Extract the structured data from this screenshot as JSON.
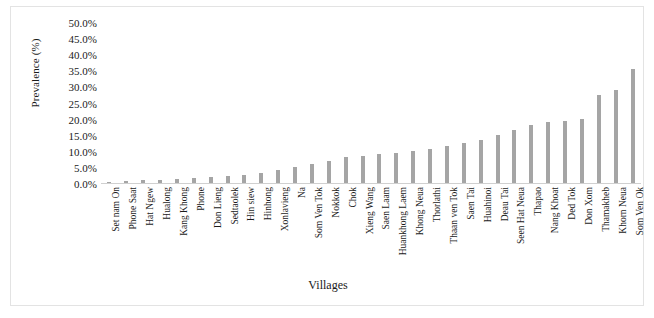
{
  "chart_data": {
    "type": "bar",
    "title": "",
    "xlabel": "Villages",
    "ylabel": "Prevalence (%)",
    "ylim": [
      0,
      50
    ],
    "grid": false,
    "legend": null,
    "y_ticks": [
      "0.0%",
      "5.0%",
      "10.0%",
      "15.0%",
      "20.0%",
      "25.0%",
      "30.0%",
      "35.0%",
      "40.0%",
      "45.0%",
      "50.0%"
    ],
    "y_tick_values": [
      0,
      5,
      10,
      15,
      20,
      25,
      30,
      35,
      40,
      45,
      50
    ],
    "bar_color": "#a5a5a5",
    "categories": [
      "Set nam On",
      "Phone Saat",
      "Hat Ngew",
      "Hualong",
      "Kang Khong",
      "Phone",
      "Don Lieng",
      "Sedtaolek",
      "Hin siew",
      "Hinhong",
      "Xonlavieng",
      "Na",
      "Som Ven Tok",
      "Nokkok",
      "Chok",
      "Xieng Wang",
      "Saen Laam",
      "Huankhong Laem",
      "Khong Neua",
      "Thorlathi",
      "Thaan ven Tok",
      "Saen Tai",
      "Huahinoi",
      "Deau Tai",
      "Seen Hat Neua",
      "Thapao",
      "Nang Khoat",
      "Ded Tok",
      "Don Xom",
      "Thamakheb",
      "Khorn Neua",
      "Som Ven Ok"
    ],
    "values": [
      0.4,
      0.6,
      0.8,
      1.0,
      1.2,
      1.5,
      1.8,
      2.2,
      2.6,
      3.0,
      4.0,
      5.0,
      6.0,
      7.0,
      8.0,
      8.5,
      9.0,
      9.5,
      10.0,
      10.5,
      11.5,
      12.5,
      13.5,
      15.0,
      16.5,
      18.0,
      19.0,
      19.5,
      20.0,
      27.5,
      29.0,
      35.5
    ]
  }
}
